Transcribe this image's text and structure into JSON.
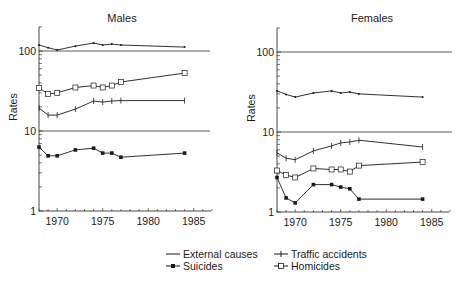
{
  "chart_data": [
    {
      "type": "line",
      "title": "Males",
      "xlabel": "",
      "ylabel": "Rates",
      "yscale": "log",
      "ylim": [
        1,
        200
      ],
      "xlim": [
        1968,
        1987
      ],
      "xticks": [
        1970,
        1975,
        1980,
        1985
      ],
      "yticks": [
        1,
        10,
        100
      ],
      "x": [
        1968,
        1969,
        1970,
        1972,
        1974,
        1975,
        1976,
        1977,
        1984
      ],
      "series": [
        {
          "name": "External causes",
          "marker": "dot",
          "values": [
            119,
            110,
            103,
            115,
            126,
            119,
            122,
            119,
            112
          ]
        },
        {
          "name": "Homicides",
          "marker": "square",
          "values": [
            34.6,
            29,
            30,
            35,
            37,
            35,
            37,
            41,
            53
          ]
        },
        {
          "name": "Traffic accidents",
          "marker": "plus",
          "values": [
            19.4,
            15.8,
            15.8,
            18.8,
            23.7,
            23,
            23.7,
            24,
            24
          ]
        },
        {
          "name": "Suicides",
          "marker": "star",
          "values": [
            6.3,
            4.9,
            4.9,
            5.8,
            6.1,
            5.3,
            5.3,
            4.7,
            5.3
          ]
        }
      ],
      "gridlines_y": [
        10,
        100
      ]
    },
    {
      "type": "line",
      "title": "Females",
      "xlabel": "",
      "ylabel": "Rates",
      "yscale": "log",
      "ylim": [
        1,
        200
      ],
      "xlim": [
        1968,
        1987
      ],
      "xticks": [
        1970,
        1975,
        1980,
        1985
      ],
      "yticks": [
        1,
        10,
        100
      ],
      "x": [
        1968,
        1969,
        1970,
        1972,
        1974,
        1975,
        1976,
        1977,
        1984
      ],
      "series": [
        {
          "name": "External causes",
          "marker": "dot",
          "values": [
            32.6,
            29.5,
            27.3,
            30.7,
            32.6,
            30.7,
            31.6,
            29.9,
            27.3
          ]
        },
        {
          "name": "Traffic accidents",
          "marker": "plus",
          "values": [
            5.5,
            4.7,
            4.5,
            5.8,
            6.7,
            7.3,
            7.5,
            7.9,
            6.5
          ]
        },
        {
          "name": "Homicides",
          "marker": "square",
          "values": [
            3.3,
            2.9,
            2.7,
            3.5,
            3.4,
            3.4,
            3.2,
            3.8,
            4.2
          ]
        },
        {
          "name": "Suicides",
          "marker": "star",
          "values": [
            2.7,
            1.5,
            1.3,
            2.2,
            2.2,
            2.05,
            1.95,
            1.45,
            1.45
          ]
        }
      ],
      "gridlines_y": [
        10,
        100
      ]
    }
  ],
  "legend": {
    "items": [
      {
        "label": "External causes",
        "marker": "dot"
      },
      {
        "label": "Suicides",
        "marker": "star"
      },
      {
        "label": "Traffic accidents",
        "marker": "plus"
      },
      {
        "label": "Homicides",
        "marker": "square"
      }
    ]
  },
  "colors": {
    "line": "#1a1a1a",
    "grid": "#333333",
    "background": "#ffffff"
  }
}
